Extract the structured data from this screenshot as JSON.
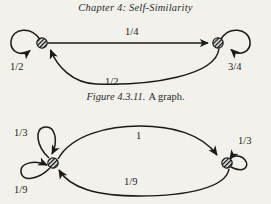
{
  "page": {
    "header": "Chapter 4: Self-Similarity",
    "background_color": "#f3f1ec",
    "ink_color": "#1a1a1a",
    "width": 271,
    "height": 204
  },
  "caption": {
    "number": "Figure 4.3.11.",
    "text": "A graph."
  },
  "graphs": [
    {
      "id": "graph-one",
      "nodes": [
        {
          "id": "left",
          "label": "",
          "cx": 42,
          "cy": 29,
          "r": 5,
          "fill_style": "crosshatch"
        },
        {
          "id": "right",
          "label": "",
          "cx": 218,
          "cy": 29,
          "r": 5,
          "fill_style": "crosshatch"
        }
      ],
      "edges": [
        {
          "id": "left-self-loop",
          "from": "left",
          "to": "left",
          "label": "1/2",
          "label_x": 12,
          "label_y": 53,
          "shape": "loop-upper-left",
          "arrow": "into-node"
        },
        {
          "id": "left-to-right",
          "from": "left",
          "to": "right",
          "label": "1/4",
          "label_x": 125,
          "label_y": 26,
          "shape": "straight-top",
          "arrow": "into-right"
        },
        {
          "id": "right-to-left",
          "from": "right",
          "to": "left",
          "label": "1/2",
          "label_x": 105,
          "label_y": 76,
          "shape": "curve-bottom",
          "arrow": "into-left"
        },
        {
          "id": "right-self-loop",
          "from": "right",
          "to": "right",
          "label": "3/4",
          "label_x": 229,
          "label_y": 53,
          "shape": "loop-upper-right",
          "arrow": "into-node"
        }
      ]
    },
    {
      "id": "graph-two",
      "nodes": [
        {
          "id": "left",
          "label": "",
          "cx": 53,
          "cy": 57,
          "r": 5,
          "fill_style": "crosshatch"
        },
        {
          "id": "right",
          "label": "",
          "cx": 227,
          "cy": 57,
          "r": 5,
          "fill_style": "crosshatch"
        }
      ],
      "edges": [
        {
          "id": "left-self-loop-upper",
          "from": "left",
          "to": "left",
          "label": "1/3",
          "label_x": 15,
          "label_y": 22,
          "shape": "loop-upper-left",
          "arrow": "into-node"
        },
        {
          "id": "left-self-loop-lower",
          "from": "left",
          "to": "left",
          "label": "1/9",
          "label_x": 15,
          "label_y": 86,
          "shape": "loop-lower-left",
          "arrow": "into-node"
        },
        {
          "id": "left-to-right",
          "from": "left",
          "to": "right",
          "label": "1",
          "label_x": 136,
          "label_y": 25,
          "shape": "curve-top",
          "arrow": "into-right"
        },
        {
          "id": "right-to-left",
          "from": "right",
          "to": "left",
          "label": "1/9",
          "label_x": 124,
          "label_y": 71,
          "shape": "curve-bottom",
          "arrow": "into-left"
        },
        {
          "id": "right-self-loop",
          "from": "right",
          "to": "right",
          "label": "1/3",
          "label_x": 239,
          "label_y": 30,
          "shape": "loop-upper-right",
          "arrow": "into-node"
        }
      ]
    }
  ]
}
